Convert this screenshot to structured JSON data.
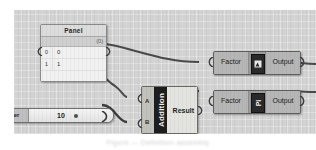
{
  "app": {
    "title": "Grasshopper node editor canvas"
  },
  "panel_node": {
    "title": "Panel",
    "count_label": "(0)",
    "rows": [
      {
        "index": "0",
        "value": "0"
      },
      {
        "index": "1",
        "value": "1"
      }
    ]
  },
  "addition_node": {
    "title": "Addition",
    "input_a": "A",
    "input_b": "B",
    "output": "Result"
  },
  "slider_node": {
    "label": "ter",
    "value": "10"
  },
  "components": [
    {
      "input_label": "Factor",
      "output_label": "Output",
      "icon": "image-thumbnail-icon",
      "mid_text": ""
    },
    {
      "input_label": "Factor",
      "output_label": "Output",
      "icon": "pi-symbol-icon",
      "mid_text": "Pi"
    }
  ],
  "caption": {
    "text": "Figure  —  Definition assembly"
  },
  "colors": {
    "canvas_bg": "#d2d2d2",
    "node_face": "#b6b6b6",
    "panel_face": "#e7e7e7",
    "accent_dark": "#1d1d1d",
    "wire": "#4a4a4a"
  }
}
